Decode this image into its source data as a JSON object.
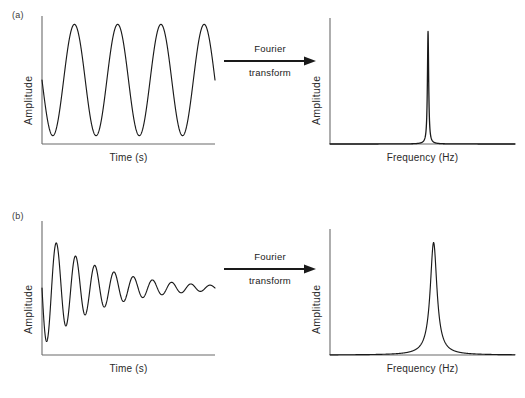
{
  "figure": {
    "background": "#ffffff",
    "line_color": "#1a1a1a",
    "axis_color": "#6b6b6b"
  },
  "panels": [
    {
      "id": "a",
      "label": "(a)",
      "time_domain": {
        "ylabel": "Amplitude",
        "xlabel": "Time (s)",
        "signal": "sine"
      },
      "freq_domain": {
        "ylabel": "Amplitude",
        "xlabel": "Frequency (Hz)",
        "signal": "delta"
      },
      "arrow": {
        "top_label": "Fourier",
        "bottom_label": "transform"
      }
    },
    {
      "id": "b",
      "label": "(b)",
      "time_domain": {
        "ylabel": "Amplitude",
        "xlabel": "Time (s)",
        "signal": "damped-sine"
      },
      "freq_domain": {
        "ylabel": "Amplitude",
        "xlabel": "Frequency (Hz)",
        "signal": "lorentzian"
      },
      "arrow": {
        "top_label": "Fourier",
        "bottom_label": "transform"
      }
    }
  ],
  "chart_data": [
    {
      "type": "line",
      "name": "panel-a-time-domain",
      "title": "",
      "xlabel": "Time (s)",
      "ylabel": "Amplitude",
      "description": "Continuous undamped sinusoid with four full cycles",
      "function": "sine",
      "cycles": 4,
      "amplitude": 1.0,
      "decay_constant": 0,
      "xlim": [
        0,
        4
      ],
      "ylim": [
        -1.15,
        1.15
      ],
      "grid": false,
      "ticks": false
    },
    {
      "type": "line",
      "name": "panel-a-frequency-domain",
      "title": "",
      "xlabel": "Frequency (Hz)",
      "ylabel": "Amplitude",
      "description": "Single sharp delta-function spike at the sinusoid frequency on a flat baseline",
      "function": "delta",
      "peak_center": 0.53,
      "peak_height": 1.0,
      "peak_halfwidth": 0.004,
      "baseline": 0.0,
      "xlim": [
        0,
        1
      ],
      "ylim": [
        0,
        1.12
      ],
      "grid": false,
      "ticks": false
    },
    {
      "type": "line",
      "name": "panel-b-time-domain",
      "title": "",
      "xlabel": "Time (s)",
      "ylabel": "Amplitude",
      "description": "Exponentially damped sinusoid (free induction decay) starting at full amplitude and decaying to zero",
      "function": "damped-sine",
      "cycles": 9,
      "amplitude": 1.0,
      "decay_constant": 3.1,
      "xlim": [
        0,
        4
      ],
      "ylim": [
        -1.15,
        1.15
      ],
      "grid": false,
      "ticks": false
    },
    {
      "type": "line",
      "name": "panel-b-frequency-domain",
      "title": "",
      "xlabel": "Frequency (Hz)",
      "ylabel": "Amplitude",
      "description": "Broadened Lorentzian line shape centred at the oscillation frequency",
      "function": "lorentzian",
      "peak_center": 0.56,
      "peak_height": 1.0,
      "peak_halfwidth": 0.022,
      "baseline": 0.0,
      "xlim": [
        0,
        1
      ],
      "ylim": [
        0,
        1.12
      ],
      "grid": false,
      "ticks": false
    }
  ]
}
